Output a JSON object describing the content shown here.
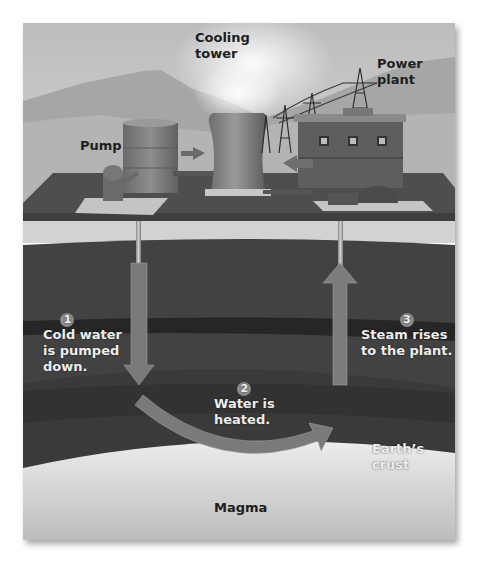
{
  "labels": {
    "cooling_tower": [
      "Cooling",
      "tower"
    ],
    "power_plant": [
      "Power",
      "plant"
    ],
    "pump": "Pump",
    "earths_crust": "Earth’s crust",
    "magma": "Magma"
  },
  "steps": [
    {
      "number": "1",
      "lines": [
        "Cold water",
        "is pumped",
        "down."
      ]
    },
    {
      "number": "2",
      "lines": [
        "Water is",
        "heated."
      ]
    },
    {
      "number": "3",
      "lines": [
        "Steam rises",
        "to the plant."
      ]
    }
  ],
  "colors": {
    "sky": "#c9c9c9",
    "mountains": "#a9a9a9",
    "ground_surface": "#4a4a4a",
    "soil_band": "#d4d4d4",
    "crust": "#3b3b3b",
    "dark_layer": "#262626",
    "magma": "#e2e2e2",
    "arrow": "#7c7c7c"
  }
}
